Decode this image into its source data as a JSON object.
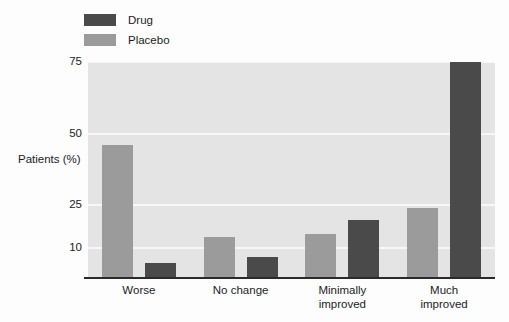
{
  "chart_data": {
    "type": "bar",
    "title": "",
    "subtitle": "",
    "xlabel": "",
    "ylabel": "Patients (%)",
    "ylabel_lines": [
      "Patients",
      "(%)"
    ],
    "categories": [
      "Worse",
      "No change",
      "Minimally improved",
      "Much improved"
    ],
    "category_lines": [
      [
        "Worse"
      ],
      [
        "No change"
      ],
      [
        "Minimally",
        "improved"
      ],
      [
        "Much",
        "improved"
      ]
    ],
    "series": [
      {
        "name": "Drug",
        "color": "#4a4a4a",
        "values": [
          5,
          7,
          20,
          75
        ]
      },
      {
        "name": "Placebo",
        "color": "#9b9b9b",
        "values": [
          46,
          14,
          15,
          24
        ]
      }
    ],
    "series_order_in_plot": [
      "Placebo",
      "Drug"
    ],
    "ylim": [
      0,
      75
    ],
    "yticks": [
      10,
      25,
      50,
      75
    ],
    "ytick_labels": [
      "10",
      "25",
      "50",
      "75"
    ],
    "grid": true,
    "grid_color": "#f7f7f7",
    "plot_background": "#e4e4e4",
    "axis_color": "#2a2a2a",
    "legend_position": "top-left"
  },
  "legend": {
    "items": [
      {
        "label": "Drug",
        "color": "#4a4a4a"
      },
      {
        "label": "Placebo",
        "color": "#9b9b9b"
      }
    ]
  }
}
